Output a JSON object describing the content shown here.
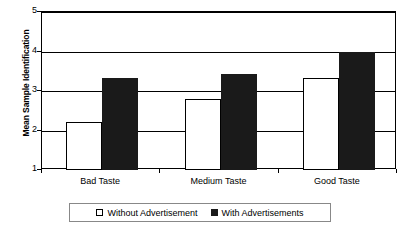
{
  "chart_data": {
    "type": "bar",
    "title": "",
    "xlabel": "",
    "ylabel": "Mean Sample Identification",
    "categories": [
      "Bad Taste",
      "Medium Taste",
      "Good Taste"
    ],
    "series": [
      {
        "name": "Without Advertisement",
        "values": [
          2.22,
          2.8,
          3.33
        ],
        "color": "#ffffff"
      },
      {
        "name": "With Advertisements",
        "values": [
          3.33,
          3.42,
          4.0
        ],
        "color": "#1a1a1a"
      }
    ],
    "ylim": [
      1,
      5
    ],
    "yticks": [
      1,
      2,
      3,
      4,
      5
    ],
    "ytick_labels": [
      "1",
      "2",
      "3",
      "4",
      "5"
    ],
    "grid": true,
    "grid_axis": "y",
    "legend_position": "bottom"
  },
  "legend": {
    "entries": [
      {
        "label": "Without Advertisement",
        "swatch": "open-square-swatch"
      },
      {
        "label": "With Advertisements",
        "swatch": "filled-square-swatch"
      }
    ]
  }
}
